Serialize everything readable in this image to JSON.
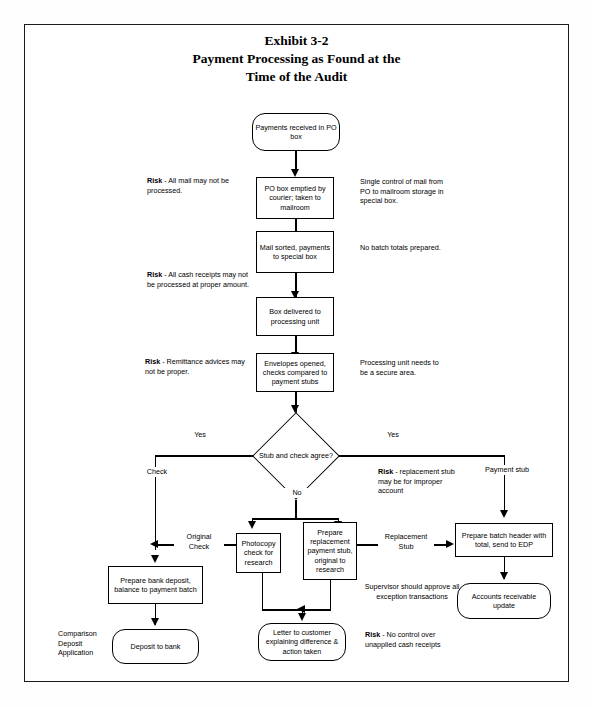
{
  "document": {
    "title_lines": [
      "Exhibit 3-2",
      "Payment Processing as Found at the",
      "Time of the Audit"
    ]
  },
  "flowchart": {
    "type": "flowchart",
    "nodes": [
      {
        "id": "n1",
        "shape": "rounded",
        "label": "Payments received in PO box"
      },
      {
        "id": "n2",
        "shape": "rect",
        "label": "PO box emptied by courier; taken to mailroom"
      },
      {
        "id": "n3",
        "shape": "rect",
        "label": "Mail sorted, payments to special box"
      },
      {
        "id": "n4",
        "shape": "rect",
        "label": "Box delivered to processing unit"
      },
      {
        "id": "n5",
        "shape": "rect",
        "label": "Envelopes opened, checks compared to payment stubs"
      },
      {
        "id": "d1",
        "shape": "diamond",
        "label": "Stub and check agree?"
      },
      {
        "id": "n6",
        "shape": "rect",
        "label": "Photocopy check for research"
      },
      {
        "id": "n7",
        "shape": "rect",
        "label": "Prepare replacement payment stub, original to research"
      },
      {
        "id": "n8",
        "shape": "rect",
        "label": "Prepare batch header with total, send to EDP"
      },
      {
        "id": "n9",
        "shape": "rounded",
        "label": "Accounts receivable update"
      },
      {
        "id": "n10",
        "shape": "rect",
        "label": "Prepare bank deposit, balance to payment batch"
      },
      {
        "id": "n11",
        "shape": "rounded",
        "label": "Deposit to bank"
      },
      {
        "id": "n12",
        "shape": "rounded",
        "label": "Letter to customer explaining difference & action taken"
      }
    ],
    "edge_labels": [
      {
        "id": "e1",
        "label": "Yes"
      },
      {
        "id": "e2",
        "label": "Yes"
      },
      {
        "id": "e3",
        "label": "No"
      },
      {
        "id": "e4",
        "label": "Check"
      },
      {
        "id": "e5",
        "label": "Payment stub"
      },
      {
        "id": "e6",
        "label": "Original Check"
      },
      {
        "id": "e7",
        "label": "Replacement Stub"
      },
      {
        "id": "e8",
        "label": "Comparison Deposit Application"
      }
    ],
    "risk_notes": [
      {
        "id": "r1",
        "bold": "Risk",
        "text": " - All mail may not be processed."
      },
      {
        "id": "r2",
        "bold": "Risk",
        "text": " - All cash receipts may not be processed at proper amount."
      },
      {
        "id": "r3",
        "bold": "Risk",
        "text": " - Remittance advices may not be proper."
      },
      {
        "id": "r4",
        "bold": "Risk",
        "text": " - replacement stub may be for improper account"
      },
      {
        "id": "r5",
        "bold": "Risk",
        "text": " - No control over unapplied cash receipts"
      }
    ],
    "control_notes": [
      {
        "id": "c1",
        "text": "Single control of mail from PO to mailroom storage in special box."
      },
      {
        "id": "c2",
        "text": "No batch totals prepared."
      },
      {
        "id": "c3",
        "text": "Processing unit needs to be a secure area."
      },
      {
        "id": "c4",
        "text": "Supervisor should approve all exception transactions"
      }
    ]
  }
}
